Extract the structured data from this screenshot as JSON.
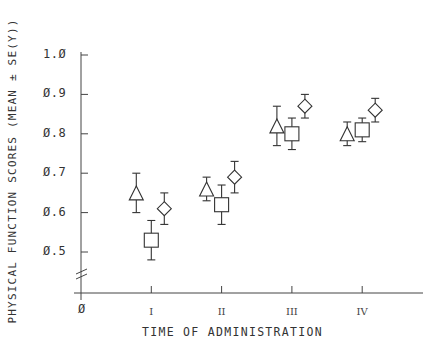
{
  "chart_data": {
    "type": "scatter",
    "title": "",
    "xlabel": "TIME OF ADMINISTRATION",
    "ylabel": "PHYSICAL FUNCTION SCORES (MEAN ± SE(Y))",
    "origin_label": "Ø",
    "categories": [
      "I",
      "II",
      "III",
      "IV"
    ],
    "yticks": [
      "1.Ø",
      "Ø.9",
      "Ø.8",
      "Ø.7",
      "Ø.6",
      "Ø.5"
    ],
    "ytick_values": [
      1.0,
      0.9,
      0.8,
      0.7,
      0.6,
      0.5
    ],
    "ylim": [
      0.5,
      1.0
    ],
    "axis_break": true,
    "grid": false,
    "legend": "none",
    "error_bars": "mean ± SE",
    "series": [
      {
        "name": "triangle",
        "marker": "triangle",
        "values": [
          0.65,
          0.66,
          0.82,
          0.8
        ],
        "err_low": [
          0.6,
          0.63,
          0.77,
          0.77
        ],
        "err_high": [
          0.7,
          0.69,
          0.87,
          0.83
        ]
      },
      {
        "name": "square",
        "marker": "square",
        "values": [
          0.53,
          0.62,
          0.8,
          0.81
        ],
        "err_low": [
          0.48,
          0.57,
          0.76,
          0.78
        ],
        "err_high": [
          0.58,
          0.67,
          0.84,
          0.84
        ]
      },
      {
        "name": "diamond",
        "marker": "diamond",
        "values": [
          0.61,
          0.69,
          0.87,
          0.86
        ],
        "err_low": [
          0.57,
          0.65,
          0.84,
          0.83
        ],
        "err_high": [
          0.65,
          0.73,
          0.9,
          0.89
        ]
      }
    ]
  }
}
